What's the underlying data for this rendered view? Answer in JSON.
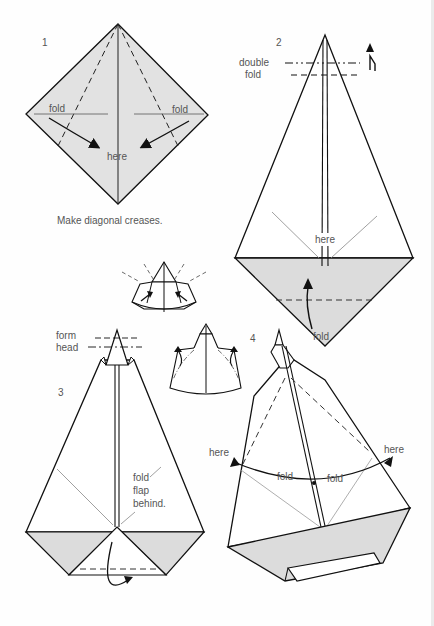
{
  "diagram": {
    "kind": "origami-instructions",
    "colors": {
      "paper_white": "#ffffff",
      "paper_shaded": "#dcdcdc",
      "diagram_fill_step1": "#e2e2e2",
      "line": "#111111",
      "text": "#555555"
    },
    "steps": [
      {
        "number": "1",
        "labels": {
          "fold_left": "fold",
          "fold_right": "fold",
          "target": "here"
        },
        "caption": "Make diagonal creases."
      },
      {
        "number": "2",
        "labels": {
          "double_fold_line1": "double",
          "double_fold_line2": "fold",
          "target": "here",
          "fold": "fold"
        }
      },
      {
        "number": "3",
        "labels": {
          "form_head_line1": "form",
          "form_head_line2": "head",
          "instruction_line1": "fold",
          "instruction_line2": "flap",
          "instruction_line3": "behind."
        }
      },
      {
        "number": "4",
        "labels": {
          "here_left": "here",
          "here_right": "here",
          "fold_left": "fold",
          "fold_right": "fold"
        }
      }
    ],
    "intermediate_figures": [
      {
        "name": "head-forming-detail-a"
      },
      {
        "name": "head-forming-detail-b"
      }
    ]
  }
}
